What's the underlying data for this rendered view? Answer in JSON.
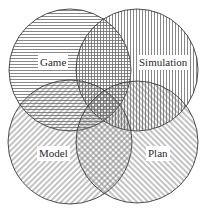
{
  "diagram": {
    "type": "venn",
    "set_count": 4,
    "stroke_color": "#3a3a3a",
    "hatch_color": "#6a6a6a",
    "background": "#ffffff",
    "sets": [
      {
        "id": "game",
        "label": "Game",
        "hatch": "horizontal",
        "cx": 70,
        "cy": 70,
        "r": 61,
        "label_x": 38,
        "label_y": 55
      },
      {
        "id": "simulation",
        "label": "Simulation",
        "hatch": "vertical",
        "cx": 137,
        "cy": 70,
        "r": 61,
        "label_x": 137,
        "label_y": 55
      },
      {
        "id": "model",
        "label": "Model",
        "hatch": "diagonal-up",
        "cx": 70,
        "cy": 142,
        "r": 62,
        "label_x": 37,
        "label_y": 146
      },
      {
        "id": "plan",
        "label": "Plan",
        "hatch": "diagonal-down",
        "cx": 137,
        "cy": 142,
        "r": 61,
        "label_x": 146,
        "label_y": 146
      }
    ]
  }
}
